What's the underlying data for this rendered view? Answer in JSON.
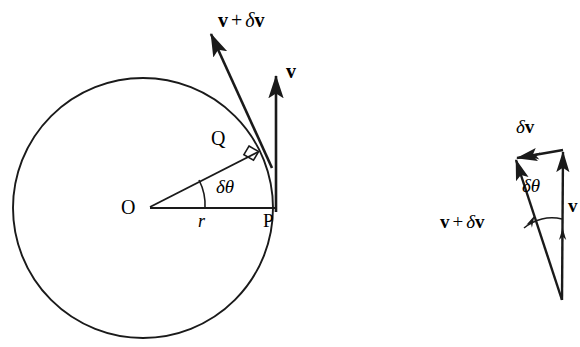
{
  "figure": {
    "background_color": "#ffffff",
    "stroke_color": "#1a1a1a",
    "text_color": "#000000",
    "width": 580,
    "height": 347
  },
  "left_diagram": {
    "name": "circle-with-velocity-vectors",
    "circle": {
      "center_x": 143,
      "center_y": 208,
      "radius": 130
    },
    "points": {
      "center_label": "O",
      "point_p_label": "P",
      "point_q_label": "Q"
    },
    "radius_label": "r",
    "angle_label": {
      "delta": "δ",
      "theta": "θ",
      "full": "δθ"
    },
    "vector_v": {
      "label_delta": "",
      "label": "v",
      "full": "v"
    },
    "vector_v_plus_dv": {
      "v": "v",
      "operator": "+",
      "delta": "δ",
      "v2": "v",
      "full": "v + δv"
    },
    "right_angle_marker": "right-angle-square-at-Q"
  },
  "right_diagram": {
    "name": "vector-triangle",
    "vector_v": {
      "label": "v",
      "full": "v"
    },
    "vector_dv": {
      "delta": "δ",
      "v": "v",
      "full": "δv"
    },
    "vector_v_plus_dv": {
      "v": "v",
      "operator": "+",
      "delta": "δ",
      "v2": "v",
      "full": "v + δv"
    },
    "angle_label": {
      "delta": "δ",
      "theta": "θ",
      "full": "δθ"
    },
    "apex_x": 562,
    "apex_y": 301,
    "top_right_x": 563,
    "top_right_y": 150,
    "top_left_x": 516,
    "top_left_y": 159
  }
}
